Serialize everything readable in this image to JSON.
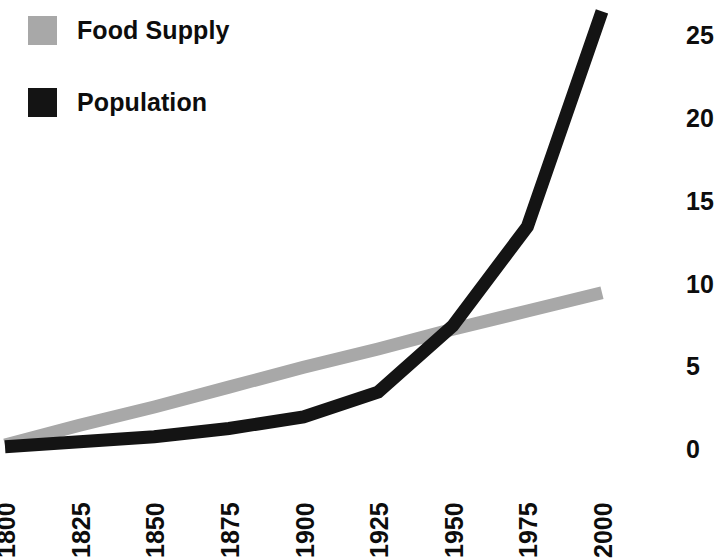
{
  "legend": {
    "position": "top-left",
    "entries": [
      {
        "label": "Food Supply",
        "swatch": "food-supply-swatch",
        "color": "#a8a8a8"
      },
      {
        "label": "Population",
        "swatch": "population-swatch",
        "color": "#141414"
      }
    ]
  },
  "axes": {
    "y": {
      "position": "right",
      "ticks": [
        "0",
        "5",
        "10",
        "15",
        "20",
        "25"
      ],
      "label": ""
    },
    "x": {
      "position": "bottom",
      "rotation_deg": -90,
      "ticks": [
        "1800",
        "1825",
        "1850",
        "1875",
        "1900",
        "1925",
        "1950",
        "1975",
        "2000"
      ],
      "label": ""
    }
  },
  "chart_data": {
    "type": "line",
    "title": "",
    "subtitle": "",
    "xlabel": "",
    "ylabel": "",
    "x": [
      1800,
      1825,
      1850,
      1875,
      1900,
      1925,
      1950,
      1975,
      2000
    ],
    "xlim": [
      1800,
      2000
    ],
    "ylim": [
      0,
      27
    ],
    "yticks": [
      0,
      5,
      10,
      15,
      20,
      25
    ],
    "grid": false,
    "legend_position": "top-left",
    "series": [
      {
        "name": "Food Supply",
        "color": "#a8a8a8",
        "line_width_px": 13,
        "values": [
          0.3,
          1.5,
          2.6,
          3.8,
          5.0,
          6.1,
          7.3,
          8.4,
          9.5
        ]
      },
      {
        "name": "Population",
        "color": "#141414",
        "line_width_px": 13,
        "values": [
          0.2,
          0.5,
          0.8,
          1.3,
          2.0,
          3.5,
          7.5,
          13.5,
          26.5
        ]
      }
    ],
    "annotations": [
      "Population curve crosses Food Supply curve near 1950",
      "Population line extends past the top of the plotted axis after 1975"
    ]
  }
}
